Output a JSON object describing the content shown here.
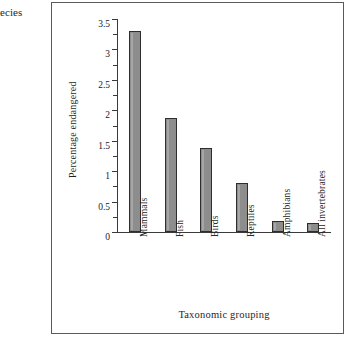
{
  "figure": {
    "caption_fragment": "ecies",
    "border_color": "#5a5a5a",
    "background": "#ffffff"
  },
  "chart_data": {
    "type": "bar",
    "title": "",
    "subtitle": "",
    "categories": [
      "Mammals",
      "Fish",
      "Birds",
      "Reptiles",
      "Amphibians",
      "All invertebrates"
    ],
    "values": [
      3.3,
      1.87,
      1.38,
      0.8,
      0.18,
      0.15
    ],
    "xlabel": "Taxonomic grouping",
    "ylabel": "Percentage endangered",
    "ylim": [
      0,
      3.5
    ],
    "ytick_labels": [
      "0",
      "0.5",
      "1",
      "1.5",
      "2",
      "2.5",
      "3",
      "3.5"
    ],
    "ytick_values": [
      0,
      0.5,
      1,
      1.5,
      2,
      2.5,
      3,
      3.5
    ],
    "yminor_tick_values": [
      0.25,
      0.75,
      1.25,
      1.75,
      2.25,
      2.75,
      3.25
    ],
    "grid": false,
    "legend": null,
    "bar_fill": "#8d8d8d",
    "bar_edge": "#2e2e2e",
    "axis_color": "#3a3a3a"
  }
}
